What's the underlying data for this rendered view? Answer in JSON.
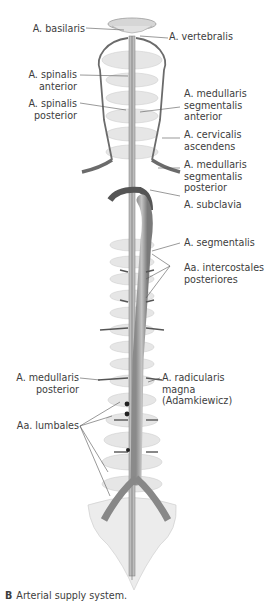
{
  "labels": {
    "basilaris": "A. basilaris",
    "vertebralis": "A. vertebralis",
    "spinalis_anterior": [
      "A. spinalis",
      "anterior"
    ],
    "spinalis_posterior": [
      "A. spinalis",
      "posterior"
    ],
    "medullaris_seg_anterior": [
      "A. medullaris",
      "segmentalis",
      "anterior"
    ],
    "cervicalis_ascendens": [
      "A. cervicalis",
      "ascendens"
    ],
    "medullaris_seg_posterior": [
      "A. medullaris",
      "segmentalis",
      "posterior"
    ],
    "subclavia": "A. subclavia",
    "segmentalis": "A. segmentalis",
    "intercostales": [
      "Aa. intercostales",
      "posteriores"
    ],
    "medullaris_posterior": [
      "A. medullaris",
      "posterior"
    ],
    "radicularis_magna": [
      "A. radicularis",
      "magna",
      "(Adamkiewicz)"
    ],
    "lumbales": "Aa. lumbales"
  },
  "caption": {
    "letter": "B",
    "text": "Arterial supply system."
  },
  "colors": {
    "vessel": "#6b6b6b",
    "bone": "#dcdcdc",
    "leader": "#555555",
    "text": "#3d3d3d"
  }
}
